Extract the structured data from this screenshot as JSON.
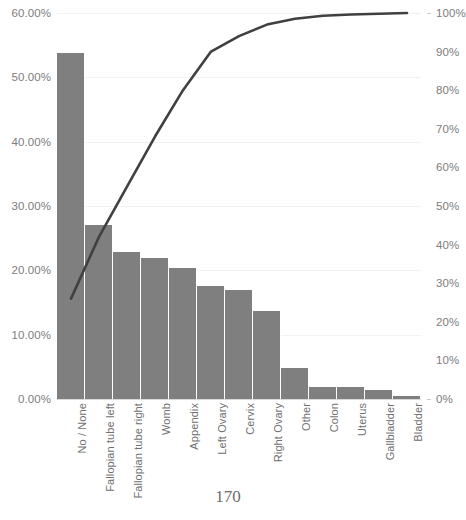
{
  "page": {
    "number": "170"
  },
  "chart_data": {
    "type": "bar",
    "title": "",
    "subtitle": "",
    "xlabel": "",
    "ylabel": "",
    "y2label": "",
    "grid": true,
    "legend": "none",
    "categories": [
      "No / None",
      "Fallopian tube left",
      "Fallopian tube right",
      "Womb",
      "Appendix",
      "Left Ovary",
      "Cervix",
      "Right Ovary",
      "Other",
      "Colon",
      "Uterus",
      "Gallbladder",
      "Bladder"
    ],
    "series": [
      {
        "name": "Frequency",
        "type": "bar",
        "axis": "left",
        "color": "#7f7f7f",
        "values": [
          53.8,
          27.0,
          22.8,
          21.9,
          20.4,
          17.6,
          16.9,
          13.7,
          4.8,
          1.9,
          1.9,
          1.4,
          0.5
        ]
      },
      {
        "name": "Cumulative %",
        "type": "line",
        "axis": "right",
        "color": "#404040",
        "values": [
          26,
          42,
          55,
          68,
          80,
          90,
          94,
          97,
          98.5,
          99.3,
          99.6,
          99.8,
          100
        ]
      }
    ],
    "ylim": [
      0,
      60
    ],
    "y2lim": [
      0,
      100
    ],
    "yticks": [
      0,
      10,
      20,
      30,
      40,
      50,
      60
    ],
    "y2ticks": [
      0,
      10,
      20,
      30,
      40,
      50,
      60,
      70,
      80,
      90,
      100
    ],
    "ytick_labels": [
      "0.00%",
      "10.00%",
      "20.00%",
      "30.00%",
      "40.00%",
      "50.00%",
      "60.00%"
    ],
    "y2tick_labels": [
      "0%",
      "10%",
      "20%",
      "30%",
      "40%",
      "50%",
      "60%",
      "70%",
      "80%",
      "90%",
      "100%"
    ]
  }
}
